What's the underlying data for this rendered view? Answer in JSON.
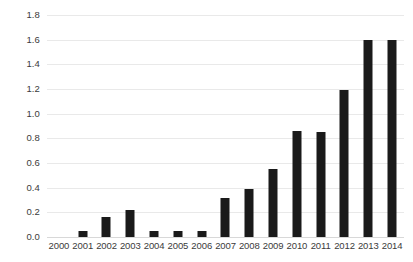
{
  "chart_data": {
    "type": "bar",
    "title": "",
    "subtitle": "",
    "xlabel": "",
    "ylabel": "",
    "categories": [
      "2000",
      "2001",
      "2002",
      "2003",
      "2004",
      "2005",
      "2006",
      "2007",
      "2008",
      "2009",
      "2010",
      "2011",
      "2012",
      "2013",
      "2014"
    ],
    "values": [
      0,
      0.05,
      0.16,
      0.22,
      0.05,
      0.05,
      0.05,
      0.32,
      0.39,
      0.55,
      0.86,
      0.85,
      1.19,
      1.6,
      1.6
    ],
    "series": [
      {
        "name": "",
        "values": [
          0,
          0.05,
          0.16,
          0.22,
          0.05,
          0.05,
          0.05,
          0.32,
          0.39,
          0.55,
          0.86,
          0.85,
          1.19,
          1.6,
          1.6
        ]
      }
    ],
    "ylim": [
      0.0,
      1.8
    ],
    "ytick_step": 0.2,
    "ytick_labels": [
      "0.0",
      "0.2",
      "0.4",
      "0.6",
      "0.8",
      "1.0",
      "1.2",
      "1.4",
      "1.6",
      "1.8"
    ],
    "ytick_values": [
      0.0,
      0.2,
      0.4,
      0.6,
      0.8,
      1.0,
      1.2,
      1.4,
      1.6,
      1.8
    ],
    "xtick_labels": [
      "2000",
      "2001",
      "2002",
      "2003",
      "2004",
      "2005",
      "2006",
      "2007",
      "2008",
      "2009",
      "2010",
      "2011",
      "2012",
      "2013",
      "2014"
    ],
    "grid": true,
    "grid_axis": "y",
    "legend": false,
    "legend_position": "none",
    "annotations": [],
    "colors": {
      "bar": "#1a1a1a",
      "gridline": "#e9e9e9",
      "baseline": "#d8d8d8",
      "tick_text": "#3b3b3b",
      "background": "#ffffff"
    }
  }
}
